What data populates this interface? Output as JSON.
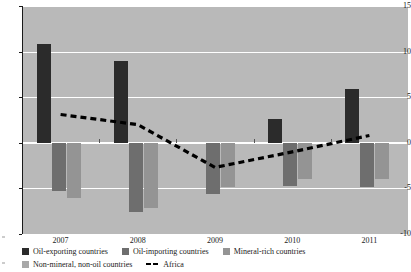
{
  "chart_data": {
    "type": "bar",
    "title": "",
    "subtitle": "",
    "xlabel": "",
    "ylabel": "",
    "categories": [
      "2007",
      "2008",
      "2009",
      "2010",
      "2011"
    ],
    "ylim": [
      -10,
      15
    ],
    "yticks": [
      15,
      10,
      5,
      0,
      -5,
      -10
    ],
    "ytick_labels": [
      "15",
      "10",
      "5",
      "0",
      "-5",
      "-10"
    ],
    "grid": true,
    "legend_position": "bottom-left",
    "series": [
      {
        "name": "Oil-exporting countries",
        "kind": "bar",
        "color": "#2b2b2b",
        "values": [
          10.8,
          9.0,
          0.0,
          2.6,
          5.9
        ]
      },
      {
        "name": "Oil-importing countries",
        "kind": "bar",
        "color": "#6e6e6e",
        "values": [
          -5.3,
          -7.6,
          -5.6,
          -4.7,
          -4.8
        ]
      },
      {
        "name": "Mineral-rich countries",
        "kind": "bar",
        "color": "#949494",
        "values": [
          -6.1,
          -7.2,
          -4.9,
          -4.0,
          -4.0
        ]
      },
      {
        "name": "Non-mineral, non-oil countries",
        "kind": "bar",
        "color": "#a8a8a8",
        "values": [
          0.0,
          0.0,
          0.0,
          0.0,
          0.0
        ]
      },
      {
        "name": "Africa",
        "kind": "line-dashed",
        "color": "#000000",
        "values": [
          3.1,
          2.0,
          -2.7,
          -1.0,
          0.8
        ]
      }
    ]
  },
  "legend": {
    "rows": [
      [
        {
          "label": "Oil-exporting countries",
          "marker": "swatch",
          "series": 0
        },
        {
          "label": "Oil-importing countries",
          "marker": "swatch",
          "series": 1
        },
        {
          "label": "Mineral-rich countries",
          "marker": "swatch",
          "series": 2
        }
      ],
      [
        {
          "label": "Non-mineral, non-oil countries",
          "marker": "swatch",
          "series": 3
        },
        {
          "label": "Africa",
          "marker": "dash",
          "series": 4
        }
      ]
    ]
  },
  "colors": {
    "plot_background": "#b9b9b9",
    "gridline": "#ffffff",
    "axis": "#1a1a1a",
    "page_background": "#ffffff"
  }
}
